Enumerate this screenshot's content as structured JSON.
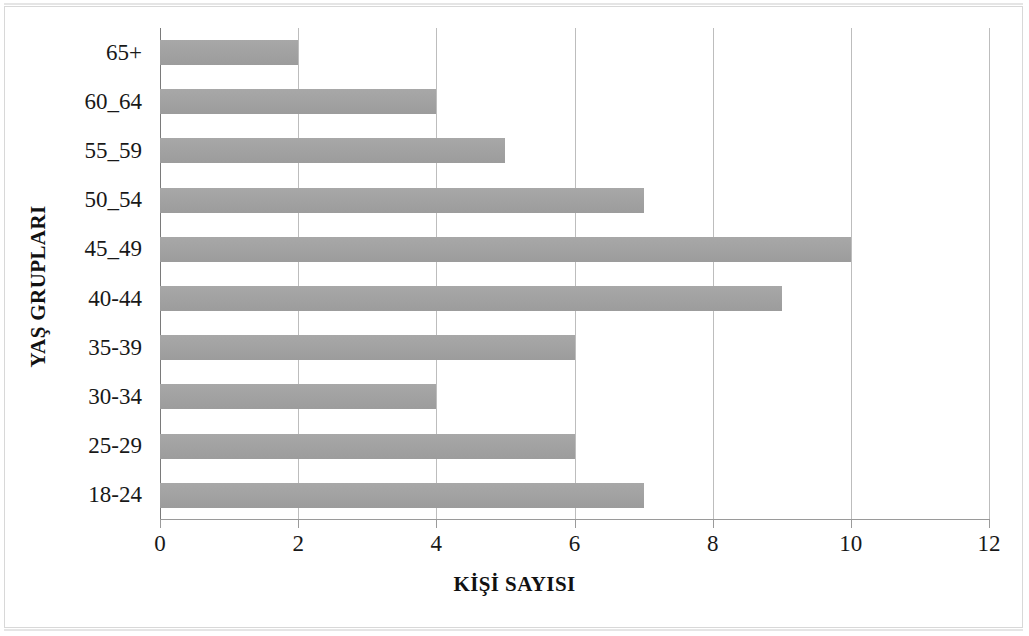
{
  "chart_data": {
    "type": "bar",
    "orientation": "horizontal",
    "title": "",
    "xlabel": "KİŞİ SAYISI",
    "ylabel": "YAŞ GRUPLARI",
    "categories": [
      "65+",
      "60_64",
      "55_59",
      "50_54",
      "45_49",
      "40-44",
      "35-39",
      "30-34",
      "25-29",
      "18-24"
    ],
    "values": [
      2,
      4,
      5,
      7,
      10,
      9,
      6,
      4,
      6,
      7
    ],
    "xlim": [
      0,
      12
    ],
    "xticks": [
      0,
      2,
      4,
      6,
      8,
      10,
      12
    ],
    "xtick_labels": [
      "0",
      "2",
      "4",
      "6",
      "8",
      "10",
      "12"
    ],
    "grid": "vertical",
    "legend": "none",
    "bar_color": "#a3a3a3",
    "gridline_color": "#bdbdbd",
    "axis_color": "#7a7a7a",
    "background_color": "#ffffff"
  }
}
